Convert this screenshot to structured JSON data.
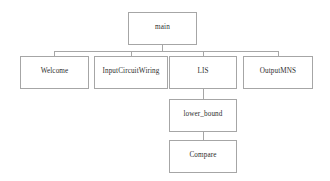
{
  "diagram": {
    "type": "structure-chart",
    "title": "main",
    "background_color": "#ffffff",
    "border_color": "#a6a6a6",
    "text_color": "#2e2e2e",
    "nodes": [
      {
        "id": "main",
        "label": "main",
        "level": 0,
        "x": 128,
        "y": 12,
        "w": 69,
        "h": 33
      },
      {
        "id": "welcome",
        "label": "Welcome",
        "level": 1,
        "x": 20,
        "y": 56,
        "w": 69,
        "h": 33
      },
      {
        "id": "input-circuit-wiring",
        "label": "InputCircuitWiring",
        "level": 1,
        "x": 94,
        "y": 56,
        "w": 74,
        "h": 33
      },
      {
        "id": "lis",
        "label": "LIS",
        "level": 1,
        "x": 169,
        "y": 56,
        "w": 68,
        "h": 33
      },
      {
        "id": "output-mns",
        "label": "OutputMNS",
        "level": 1,
        "x": 243,
        "y": 56,
        "w": 70,
        "h": 33
      },
      {
        "id": "lower-bound",
        "label": "lower_bound",
        "level": 2,
        "x": 169,
        "y": 99,
        "w": 68,
        "h": 33
      },
      {
        "id": "compare",
        "label": "Compare",
        "level": 3,
        "x": 169,
        "y": 140,
        "w": 68,
        "h": 33
      }
    ],
    "edges": [
      {
        "from": "main",
        "to": "welcome"
      },
      {
        "from": "main",
        "to": "input-circuit-wiring"
      },
      {
        "from": "main",
        "to": "lis"
      },
      {
        "from": "main",
        "to": "output-mns"
      },
      {
        "from": "lis",
        "to": "lower-bound"
      },
      {
        "from": "lower-bound",
        "to": "compare"
      }
    ],
    "connector_geometry": {
      "bus_y": 51,
      "main_drop": {
        "x": 162,
        "y": 45,
        "h": 6
      },
      "bus": {
        "x": 54,
        "y": 51,
        "w": 224
      },
      "child_drops": [
        {
          "x": 54,
          "y": 51,
          "h": 5
        },
        {
          "x": 131,
          "y": 51,
          "h": 5
        },
        {
          "x": 203,
          "y": 51,
          "h": 5
        },
        {
          "x": 278,
          "y": 51,
          "h": 5
        }
      ],
      "lis_to_lower_bound": {
        "x": 203,
        "y": 89,
        "h": 10
      },
      "lower_bound_to_compare": {
        "x": 203,
        "y": 132,
        "h": 8
      }
    }
  }
}
